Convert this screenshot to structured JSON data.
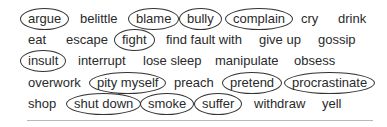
{
  "rows": [
    [
      {
        "text": "argue",
        "circled": true,
        "x": 28
      },
      {
        "text": "belittle",
        "circled": false,
        "x": 80
      },
      {
        "text": "blame",
        "circled": true,
        "x": 136
      },
      {
        "text": "bully",
        "circled": true,
        "x": 187
      },
      {
        "text": "complain",
        "circled": true,
        "x": 233
      },
      {
        "text": "cry",
        "circled": false,
        "x": 301
      },
      {
        "text": "drink",
        "circled": false,
        "x": 338
      }
    ],
    [
      {
        "text": "eat",
        "circled": false,
        "x": 28
      },
      {
        "text": "escape",
        "circled": false,
        "x": 66
      },
      {
        "text": "fight",
        "circled": true,
        "x": 122
      },
      {
        "text": "find fault with",
        "circled": false,
        "x": 166
      },
      {
        "text": "give up",
        "circled": false,
        "x": 259
      },
      {
        "text": "gossip",
        "circled": false,
        "x": 318
      }
    ],
    [
      {
        "text": "insult",
        "circled": true,
        "x": 28
      },
      {
        "text": "interrupt",
        "circled": false,
        "x": 78
      },
      {
        "text": "lose sleep",
        "circled": false,
        "x": 143
      },
      {
        "text": "manipulate",
        "circled": false,
        "x": 215
      },
      {
        "text": "obsess",
        "circled": false,
        "x": 294
      }
    ],
    [
      {
        "text": "overwork",
        "circled": false,
        "x": 28
      },
      {
        "text": "pity myself",
        "circled": true,
        "x": 97
      },
      {
        "text": "preach",
        "circled": false,
        "x": 174
      },
      {
        "text": "pretend",
        "circled": true,
        "x": 230
      },
      {
        "text": "procrastinate",
        "circled": true,
        "x": 292
      }
    ],
    [
      {
        "text": "shop",
        "circled": false,
        "x": 28
      },
      {
        "text": "shut down",
        "circled": true,
        "x": 74
      },
      {
        "text": "smoke",
        "circled": true,
        "x": 148
      },
      {
        "text": "suffer",
        "circled": true,
        "x": 202
      },
      {
        "text": "withdraw",
        "circled": false,
        "x": 254
      },
      {
        "text": "yell",
        "circled": false,
        "x": 322
      }
    ]
  ],
  "row_y": [
    11,
    32,
    53,
    75,
    96
  ],
  "colors": {
    "text": "#2a2a2a",
    "ellipse": "#333333",
    "rule": "#b8b8b8"
  }
}
